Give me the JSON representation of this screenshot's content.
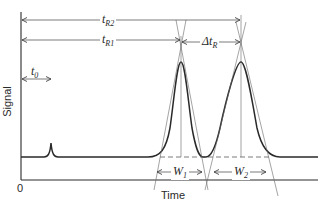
{
  "diagram": {
    "axes": {
      "y_label": "Signal",
      "x_label": "Time",
      "origin_label": "0"
    },
    "annotations": {
      "t_R2": {
        "main": "t",
        "sub": "R2"
      },
      "t_R1": {
        "main": "t",
        "sub": "R1"
      },
      "t_0": {
        "main": "t",
        "sub": "0"
      },
      "delta_t_R": {
        "main": "Δt",
        "sub": "R"
      },
      "W_1": {
        "main": "W",
        "sub": "1"
      },
      "W_2": {
        "main": "W",
        "sub": "2"
      }
    },
    "features": {
      "injection_spike": "small spike at t0",
      "peak_1": "Gaussian peak at tR1",
      "peak_2": "Gaussian peak at tR2",
      "baseline": "dashed baseline between tangents"
    },
    "colors": {
      "line": "#2a2a2a",
      "thin": "#555555",
      "background": "#ffffff"
    }
  }
}
